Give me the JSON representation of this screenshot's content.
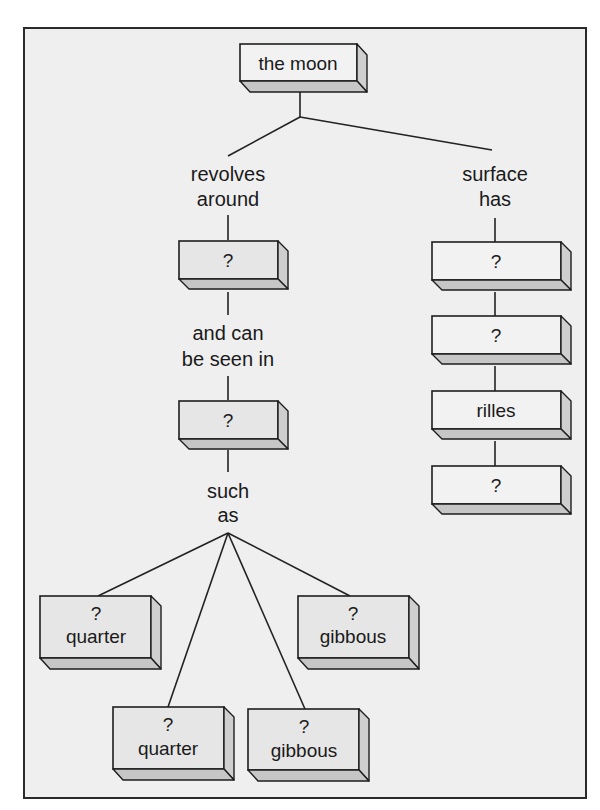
{
  "diagram": {
    "root": {
      "label": "the moon"
    },
    "left_branch": {
      "link1": [
        "revolves",
        "around"
      ],
      "node1": {
        "label": "?"
      },
      "link2": [
        "and can",
        "be seen in"
      ],
      "node2": {
        "label": "?"
      },
      "link3": [
        "such",
        "as"
      ],
      "leaves": [
        {
          "line1": "?",
          "line2": "quarter"
        },
        {
          "line1": "?",
          "line2": "quarter"
        },
        {
          "line1": "?",
          "line2": "gibbous"
        },
        {
          "line1": "?",
          "line2": "gibbous"
        }
      ]
    },
    "right_branch": {
      "link1": [
        "surface",
        "has"
      ],
      "nodes": [
        {
          "label": "?"
        },
        {
          "label": "?"
        },
        {
          "label": "rilles"
        },
        {
          "label": "?"
        }
      ]
    }
  },
  "colors": {
    "background": "#efefef",
    "box_gray": "#e6e6e6",
    "box_white": "#f2f2f2",
    "box_shade": "#c6c6c6",
    "line": "#222222"
  }
}
